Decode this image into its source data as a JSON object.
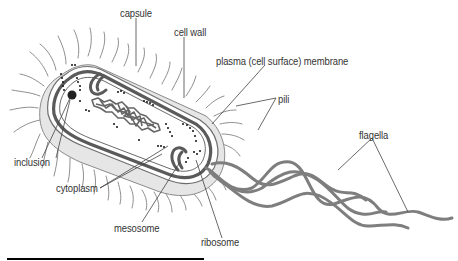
{
  "diagram": {
    "colors": {
      "outline": "#555555",
      "wall": "#5a5a5a",
      "capsule_fill": "#e4e4e4",
      "cytoplasm_fill": "#ffffff",
      "appendage": "#8a8a8a",
      "flagella": "#7a7a7a",
      "leader_line": "#444444",
      "text": "#333333",
      "dna": "#666666",
      "ribosome": "#111111",
      "underline": "#000000"
    },
    "labels": [
      {
        "id": "capsule",
        "text": "capsule",
        "x": 120,
        "y": 8
      },
      {
        "id": "cell-wall",
        "text": "cell wall",
        "x": 174,
        "y": 27
      },
      {
        "id": "plasma-membrane",
        "text": "plasma (cell surface) membrane",
        "x": 216,
        "y": 56
      },
      {
        "id": "pili",
        "text": "pili",
        "x": 278,
        "y": 94
      },
      {
        "id": "flagella",
        "text": "flagella",
        "x": 359,
        "y": 130
      },
      {
        "id": "inclusion",
        "text": "inclusion",
        "x": 14,
        "y": 157
      },
      {
        "id": "cytoplasm",
        "text": "cytoplasm",
        "x": 56,
        "y": 183
      },
      {
        "id": "mesosome",
        "text": "mesosome",
        "x": 114,
        "y": 223
      },
      {
        "id": "ribosome",
        "text": "ribosome",
        "x": 201,
        "y": 237
      }
    ],
    "underline": {
      "x1": 7,
      "x2": 204,
      "y": 259
    }
  }
}
